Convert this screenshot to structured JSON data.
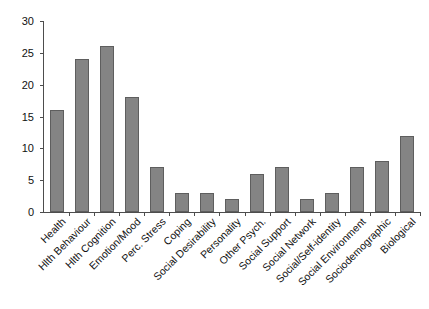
{
  "chart_data": {
    "type": "bar",
    "title": "",
    "subtitle": "",
    "xlabel": "",
    "ylabel": "",
    "ylim": [
      0,
      30
    ],
    "ytick_values": [
      0,
      5,
      10,
      15,
      20,
      25,
      30
    ],
    "ytick_labels": [
      "0",
      "5",
      "10",
      "15",
      "20",
      "25",
      "30"
    ],
    "grid": false,
    "legend": false,
    "legend_position": "none",
    "bar_color": "#848484",
    "bar_edge_color": "#5e5e5e",
    "axis_color": "#4d4d4d",
    "xtick_label_rotation": -45,
    "categories": [
      "Health",
      "Hlth Behaviour",
      "Hlth Cognition",
      "Emotion/Mood",
      "Perc. Stress",
      "Coping",
      "Social Desirability",
      "Personality",
      "Other Psych.",
      "Social Support",
      "Social Network",
      "Social/Self-identity",
      "Social Environment",
      "Sociodemographic",
      "Biological"
    ],
    "values": [
      16,
      24,
      26,
      18,
      7,
      3,
      3,
      2,
      6,
      7,
      2,
      3,
      7,
      8,
      12
    ]
  }
}
